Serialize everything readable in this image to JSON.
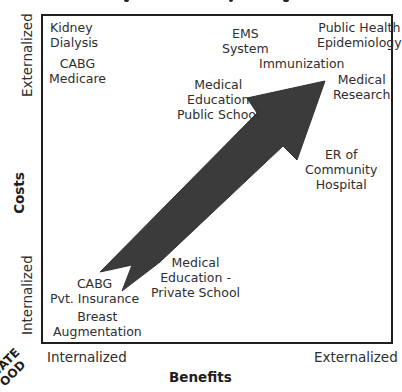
{
  "diagram": {
    "frame_color": "#1e1e1e",
    "arrow_color": "#3a3a3a",
    "y_axis": {
      "title": "Costs",
      "top_label": "Externalized",
      "bottom_label": "Internalized"
    },
    "x_axis": {
      "title": "Benefits",
      "left_label": "Internalized",
      "right_label": "Externalized"
    },
    "corner_stamp": {
      "line1": "VATE",
      "line2": "OOD"
    },
    "items": [
      {
        "id": "kidney-dialysis",
        "text": "Kidney\nDialysis"
      },
      {
        "id": "cabg-medicare",
        "text": "CABG\nMedicare"
      },
      {
        "id": "ems-system",
        "text": "EMS\nSystem"
      },
      {
        "id": "public-health-epidemiology",
        "text": "Public Health\nEpidemiology"
      },
      {
        "id": "immunization",
        "text": "Immunization"
      },
      {
        "id": "medical-research",
        "text": "Medical\nResearch"
      },
      {
        "id": "medical-education-public",
        "text": "Medical\nEducation\nPublic School"
      },
      {
        "id": "er-community-hospital",
        "text": "ER of\nCommunity\nHospital"
      },
      {
        "id": "medical-education-private",
        "text": "Medical\nEducation -\nPrivate School"
      },
      {
        "id": "cabg-pvt-insurance",
        "text": "CABG\nPvt. Insurance"
      },
      {
        "id": "breast-augmentation",
        "text": "Breast\nAugmentation"
      }
    ]
  }
}
